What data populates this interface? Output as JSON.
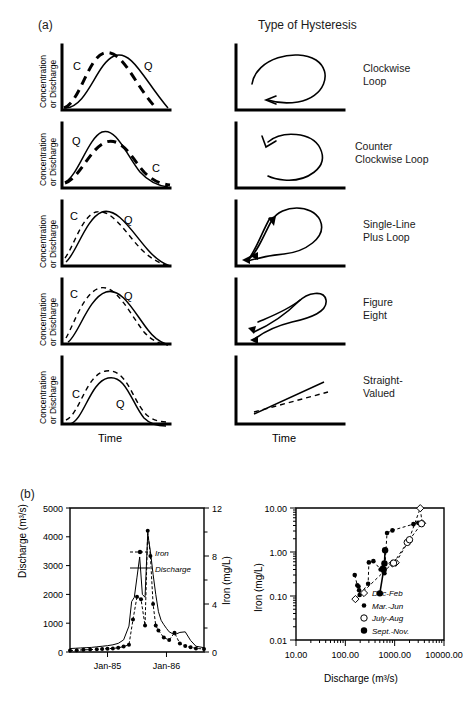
{
  "figure": {
    "panel_a_tag": "(a)",
    "panel_b_tag": "(b)",
    "column_header": "Type of Hysteresis",
    "y_axis_label_line1": "Concentration",
    "y_axis_label_line2": "or Discharge",
    "x_axis_label": "Time",
    "series_marker_c": "C",
    "series_marker_q": "Q"
  },
  "hysteresis_rows": [
    {
      "type_label_line1": "Clockwise",
      "type_label_line2": "Loop",
      "loop_direction": "clockwise"
    },
    {
      "type_label_line1": "Counter",
      "type_label_line2": "Clockwise Loop",
      "loop_direction": "counter-clockwise"
    },
    {
      "type_label_line1": "Single-Line",
      "type_label_line2": "Plus Loop",
      "loop_direction": "single-line-plus-loop"
    },
    {
      "type_label_line1": "Figure",
      "type_label_line2": "Eight",
      "loop_direction": "figure-eight"
    },
    {
      "type_label_line1": "Straight-",
      "type_label_line2": "Valued",
      "loop_direction": "straight-valued"
    }
  ],
  "chart_data": [
    {
      "type": "line",
      "title": "",
      "xlabel": "",
      "ylabel": "Discharge (m³/s)",
      "y2label": "Iron (mg/L)",
      "ylim": [
        0,
        5000
      ],
      "y2lim": [
        0,
        12
      ],
      "yticks": [
        0,
        1000,
        2000,
        3000,
        4000,
        5000
      ],
      "ytick_labels": [
        "0",
        "1000",
        "2000",
        "3000",
        "4000",
        "5000"
      ],
      "y2ticks": [
        0,
        2,
        4,
        6,
        8,
        10,
        12
      ],
      "y2tick_labels": [
        "0",
        "",
        "4",
        "",
        "8",
        "",
        "12"
      ],
      "xtick_labels": [
        "Jan-85",
        "Jan-86"
      ],
      "legend": [
        {
          "label": "Iron",
          "style": "dashed-with-circles"
        },
        {
          "label": "Discharge",
          "style": "solid-line"
        }
      ],
      "series": [
        {
          "name": "Discharge",
          "axis": "left",
          "x": [
            0.0,
            0.04,
            0.08,
            0.12,
            0.16,
            0.2,
            0.24,
            0.28,
            0.32,
            0.36,
            0.4,
            0.44,
            0.46,
            0.48,
            0.5,
            0.52,
            0.54,
            0.56,
            0.58,
            0.6,
            0.62,
            0.64,
            0.66,
            0.68,
            0.7,
            0.72,
            0.74,
            0.78,
            0.82,
            0.86,
            0.9,
            0.94,
            1.0
          ],
          "values": [
            120,
            130,
            140,
            150,
            160,
            180,
            200,
            220,
            250,
            300,
            420,
            900,
            1750,
            1900,
            2600,
            3300,
            2000,
            1900,
            4100,
            3500,
            2700,
            2000,
            1400,
            1100,
            950,
            820,
            700,
            600,
            680,
            700,
            400,
            200,
            150
          ]
        },
        {
          "name": "Iron",
          "axis": "right",
          "x": [
            0.0,
            0.05,
            0.1,
            0.15,
            0.2,
            0.24,
            0.28,
            0.32,
            0.36,
            0.4,
            0.44,
            0.47,
            0.5,
            0.53,
            0.56,
            0.58,
            0.6,
            0.62,
            0.64,
            0.66,
            0.7,
            0.74,
            0.78,
            0.82,
            0.86,
            0.9,
            0.94,
            1.0
          ],
          "values": [
            0.12,
            0.15,
            0.18,
            0.2,
            0.22,
            0.25,
            0.28,
            0.3,
            0.35,
            0.45,
            0.6,
            2.7,
            4.6,
            4.4,
            2.2,
            10.1,
            8.0,
            4.0,
            2.2,
            1.8,
            1.2,
            1.0,
            1.6,
            0.7,
            0.5,
            0.4,
            0.3,
            0.25
          ]
        }
      ]
    },
    {
      "type": "scatter",
      "title": "",
      "xlabel": "Discharge (m³/s)",
      "ylabel": "Iron (mg/L)",
      "xscale": "log",
      "yscale": "log",
      "xlim": [
        10,
        10000
      ],
      "ylim": [
        0.01,
        10
      ],
      "xtick_labels": [
        "10.00",
        "100.00",
        "1000.00",
        "10000.00"
      ],
      "ytick_labels": [
        "0.01",
        "0.10",
        "1.00",
        "10.00"
      ],
      "legend_position": "lower-right",
      "legend": [
        {
          "label": "Dec-Feb",
          "marker": "open-diamond"
        },
        {
          "label": "Mar.-Jun",
          "marker": "filled-circle-small"
        },
        {
          "label": "July-Aug",
          "marker": "open-circle"
        },
        {
          "label": "Sept.-Nov.",
          "marker": "filled-circle"
        }
      ],
      "series": [
        {
          "name": "Dec-Feb",
          "marker": "open-diamond",
          "points": [
            [
              160,
              0.085
            ],
            [
              900,
              0.55
            ],
            [
              1050,
              0.57
            ],
            [
              1900,
              1.75
            ],
            [
              3300,
              9.9
            ],
            [
              3600,
              4.5
            ]
          ]
        },
        {
          "name": "Mar.-Jun",
          "marker": "filled-circle-small",
          "points": [
            [
              155,
              0.3
            ],
            [
              175,
              0.175
            ],
            [
              185,
              0.165
            ],
            [
              190,
              0.135
            ],
            [
              195,
              0.105
            ],
            [
              290,
              0.19
            ],
            [
              300,
              0.58
            ],
            [
              370,
              0.62
            ],
            [
              520,
              0.4
            ],
            [
              560,
              0.44
            ],
            [
              600,
              0.35
            ],
            [
              620,
              0.33
            ],
            [
              700,
              2.7
            ],
            [
              900,
              3.1
            ],
            [
              2400,
              4.3
            ],
            [
              3000,
              4.6
            ]
          ]
        },
        {
          "name": "July-Aug",
          "marker": "open-circle",
          "points": [
            [
              950,
              0.56
            ],
            [
              1800,
              1.65
            ],
            [
              2000,
              1.9
            ],
            [
              3500,
              4.4
            ]
          ]
        },
        {
          "name": "Sept.-Nov.",
          "marker": "filled-circle",
          "points": [
            [
              500,
              0.115
            ],
            [
              600,
              0.4
            ],
            [
              620,
              0.55
            ],
            [
              640,
              1.1
            ]
          ]
        }
      ]
    }
  ]
}
